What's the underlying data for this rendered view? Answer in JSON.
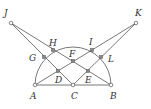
{
  "diagram": {
    "type": "geometry",
    "points": {
      "A": {
        "label": "A",
        "x": 35,
        "y": 85
      },
      "B": {
        "label": "B",
        "x": 111,
        "y": 85
      },
      "C": {
        "label": "C",
        "x": 73,
        "y": 85
      },
      "D": {
        "label": "D",
        "x": 58,
        "y": 71
      },
      "E": {
        "label": "E",
        "x": 88,
        "y": 71
      },
      "F": {
        "label": "F",
        "x": 73,
        "y": 61
      },
      "G": {
        "label": "G",
        "x": 44,
        "y": 57
      },
      "H": {
        "label": "H",
        "x": 53,
        "y": 50
      },
      "I": {
        "label": "I",
        "x": 92,
        "y": 50
      },
      "J": {
        "label": "J",
        "x": 11,
        "y": 23
      },
      "K": {
        "label": "K",
        "x": 136,
        "y": 23
      },
      "L": {
        "label": "L",
        "x": 101,
        "y": 57
      }
    },
    "segments": [
      [
        "A",
        "B"
      ],
      [
        "J",
        "C"
      ],
      [
        "J",
        "B"
      ],
      [
        "K",
        "C"
      ],
      [
        "K",
        "A"
      ],
      [
        "A",
        "H"
      ],
      [
        "B",
        "I"
      ]
    ],
    "arc": {
      "center": "C",
      "radius": 38,
      "from": "A",
      "to": "B",
      "side": "upper"
    }
  }
}
